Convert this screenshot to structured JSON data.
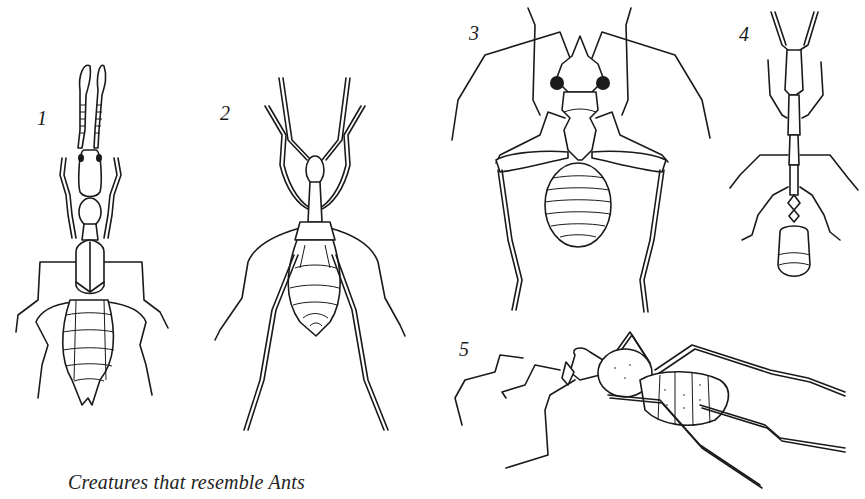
{
  "plate": {
    "caption": "Creatures that resemble Ants",
    "figures": [
      {
        "number": "1",
        "label": "1"
      },
      {
        "number": "2",
        "label": "2"
      },
      {
        "number": "3",
        "label": "3"
      },
      {
        "number": "4",
        "label": "4"
      },
      {
        "number": "5",
        "label": "5"
      }
    ]
  },
  "colors": {
    "background": "#ffffff",
    "ink": "#1a1a1a"
  }
}
